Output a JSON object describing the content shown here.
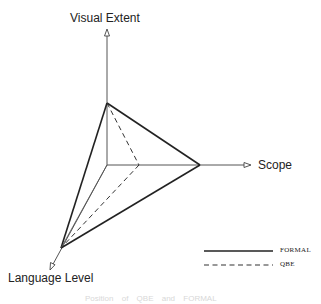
{
  "diagram": {
    "axes": {
      "vertical": {
        "label": "Visual Extent"
      },
      "horizontal": {
        "label": "Scope"
      },
      "diagonal": {
        "label": "Language Level"
      }
    },
    "legend": [
      {
        "label": "FORMAL",
        "style": "solid"
      },
      {
        "label": "QBE",
        "style": "dashed"
      }
    ],
    "caption": "Position of QBE and FORMAL",
    "colors": {
      "line": "#222222",
      "axis": "#555555"
    }
  }
}
